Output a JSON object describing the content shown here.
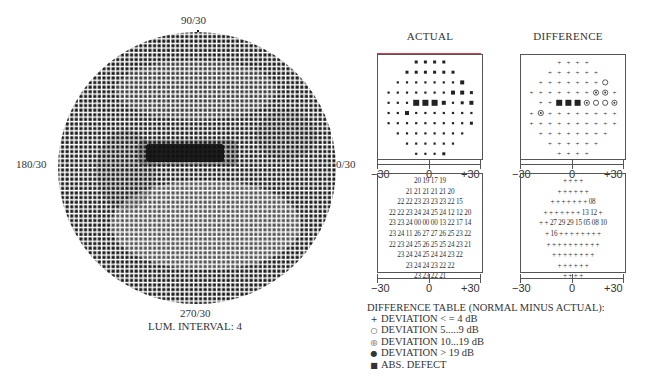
{
  "greyscale_plot": {
    "label_top": "90/30",
    "label_bottom": "270/30",
    "label_left": "180/30",
    "label_right": "0/30",
    "caption": "LUM. INTERVAL: 4"
  },
  "panels": {
    "actual_title": "ACTUAL",
    "difference_title": "DIFFERENCE",
    "scale": {
      "left": "−30",
      "center": "0",
      "right": "+30"
    }
  },
  "legend": {
    "title": "DIFFERENCE TABLE (NORMAL MINUS ACTUAL):",
    "items": [
      {
        "symbol": "+",
        "label": "DEVIATION < = 4 dB"
      },
      {
        "symbol": "○",
        "label": "DEVIATION 5.....9 dB"
      },
      {
        "symbol": "◎",
        "label": "DEVIATION 10...19 dB"
      },
      {
        "symbol": "●",
        "label": "DEVIATION > 19 dB"
      },
      {
        "symbol": "■",
        "label": "ABS. DEFECT"
      }
    ]
  },
  "chart_data": [
    {
      "type": "heatmap",
      "title": "Greyscale visual field",
      "axis_labels": {
        "top": "90/30",
        "bottom": "270/30",
        "left": "180/30",
        "right": "0/30"
      },
      "caption": "LUM. INTERVAL: 4",
      "notes": "Circular dot-matrix greyscale; dense dark horizontal band just above center (absolute defect region) slightly nasal of fixation."
    },
    {
      "type": "table",
      "title": "ACTUAL (threshold values, dB)",
      "xlabel_ticks": [
        "−30",
        "0",
        "+30"
      ],
      "rows": [
        [
          "20",
          "19",
          "17",
          "19"
        ],
        [
          "21",
          "21",
          "21",
          "21",
          "21",
          "20"
        ],
        [
          "22",
          "22",
          "23",
          "23",
          "23",
          "23",
          "22",
          "15"
        ],
        [
          "22",
          "22",
          "23",
          "24",
          "24",
          "25",
          "24",
          "12",
          "12",
          "20"
        ],
        [
          "23",
          "23",
          "24",
          "00",
          "00",
          "00",
          "13",
          "22",
          "17",
          "14"
        ],
        [
          "23",
          "24",
          "11",
          "26",
          "27",
          "27",
          "26",
          "25",
          "23",
          "22"
        ],
        [
          "22",
          "23",
          "24",
          "25",
          "26",
          "25",
          "25",
          "24",
          "23",
          "21"
        ],
        [
          "23",
          "24",
          "24",
          "25",
          "24",
          "24",
          "23",
          "22"
        ],
        [
          "23",
          "24",
          "24",
          "23",
          "22",
          "22"
        ],
        [
          "23",
          "23",
          "22",
          "21"
        ]
      ]
    },
    {
      "type": "table",
      "title": "DIFFERENCE (normal minus actual, dB)",
      "xlabel_ticks": [
        "−30",
        "0",
        "+30"
      ],
      "rows": [
        [
          "+",
          "+",
          "+",
          "+"
        ],
        [
          "+",
          "+",
          "+",
          "+",
          "+",
          "+"
        ],
        [
          "+",
          "+",
          "+",
          "+",
          "+",
          "+",
          "+",
          "08"
        ],
        [
          "+",
          "+",
          "+",
          "+",
          "+",
          "+",
          "+",
          "13",
          "12",
          "+"
        ],
        [
          "+",
          "+",
          "27",
          "29",
          "29",
          "15",
          "05",
          "08",
          "10"
        ],
        [
          "+",
          "16",
          "+",
          "+",
          "+",
          "+",
          "+",
          "+",
          "+",
          "+"
        ],
        [
          "+",
          "+",
          "+",
          "+",
          "+",
          "+",
          "+",
          "+",
          "+",
          "+"
        ],
        [
          "+",
          "+",
          "+",
          "+",
          "+",
          "+",
          "+",
          "+"
        ],
        [
          "+",
          "+",
          "+",
          "+",
          "+",
          "+"
        ],
        [
          "+",
          "+",
          "+",
          "+"
        ]
      ]
    }
  ]
}
